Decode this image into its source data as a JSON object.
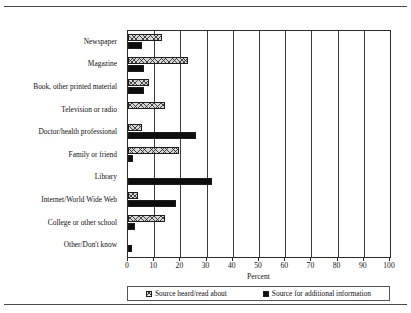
{
  "chart_data": {
    "type": "bar",
    "orientation": "horizontal",
    "title": "",
    "xlabel": "Percent",
    "ylabel": "",
    "xlim": [
      0,
      100
    ],
    "xticks": [
      0,
      10,
      20,
      30,
      40,
      50,
      60,
      70,
      80,
      90,
      100
    ],
    "xtick_labels": [
      "0",
      "10",
      "20",
      "30",
      "40",
      "50",
      "60",
      "70",
      "80",
      "90",
      "100"
    ],
    "grid": "vertical",
    "legend_position": "bottom",
    "categories": [
      "Newspaper",
      "Magazine",
      "Book, other printed material",
      "Television or radio",
      "Doctor/health professional",
      "Family or friend",
      "Library",
      "Internet/World Wide Web",
      "College or other school",
      "Other/Don't know"
    ],
    "series": [
      {
        "name": "Source heard/read about",
        "pattern": "hatched",
        "color": "#d6d6d6",
        "values": [
          13,
          23,
          8,
          14,
          5.5,
          19.5,
          0,
          4,
          14,
          0
        ]
      },
      {
        "name": "Source for additional information",
        "pattern": "solid",
        "color": "#0d0d0d",
        "values": [
          5.5,
          6,
          6,
          0,
          26,
          2,
          32,
          18.5,
          2.5,
          1.5
        ]
      }
    ]
  },
  "axis": {
    "x_title": "Percent"
  },
  "legend": {
    "items": [
      {
        "label": "Source heard/read about",
        "swatch": "hatched-square-icon"
      },
      {
        "label": "Source for additional information",
        "swatch": "solid-square-icon"
      }
    ]
  }
}
